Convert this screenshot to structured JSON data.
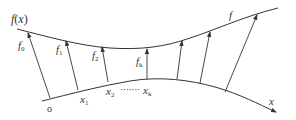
{
  "diagram": {
    "type": "function-mapping-curves",
    "colors": {
      "stroke": "#333333",
      "text": "#333333",
      "background": "#ffffff"
    },
    "upper_curve": {
      "label": "f",
      "points": [
        [
          17,
          29
        ],
        [
          65,
          42
        ],
        [
          100,
          48
        ],
        [
          150,
          48
        ],
        [
          190,
          38
        ],
        [
          230,
          24
        ],
        [
          278,
          8
        ]
      ]
    },
    "lower_curve": {
      "label": "x",
      "points": [
        [
          42,
          101
        ],
        [
          80,
          92
        ],
        [
          110,
          84
        ],
        [
          150,
          79
        ],
        [
          190,
          82
        ],
        [
          230,
          92
        ],
        [
          260,
          104
        ],
        [
          276,
          112
        ]
      ]
    },
    "arrows": [
      {
        "from": [
          50,
          98
        ],
        "to": [
          28,
          33
        ],
        "label": "f0"
      },
      {
        "from": [
          78,
          90
        ],
        "to": [
          66,
          41
        ],
        "label": "f1"
      },
      {
        "from": [
          108,
          82
        ],
        "to": [
          102,
          47
        ],
        "label": "f2"
      },
      {
        "from": [
          147,
          79
        ],
        "to": [
          147,
          49
        ],
        "label": "fk"
      },
      {
        "from": [
          177,
          79
        ],
        "to": [
          182,
          40
        ],
        "label": ""
      },
      {
        "from": [
          200,
          83
        ],
        "to": [
          210,
          31
        ],
        "label": ""
      },
      {
        "from": [
          225,
          92
        ],
        "to": [
          258,
          14
        ],
        "label": ""
      }
    ]
  },
  "labels": {
    "fx_main": "f",
    "fx_paren_open": "(",
    "fx_var": "x",
    "fx_paren_close": ")",
    "f_curve": "f",
    "x_axis": "x",
    "origin": "o",
    "f0_base": "f",
    "f0_sub": "0",
    "f1_base": "f",
    "f1_sub": "1",
    "f2_base": "f",
    "f2_sub": "2",
    "fk_base": "f",
    "fk_sub": "k",
    "x1_base": "x",
    "x1_sub": "1",
    "x2_base": "x",
    "x2_sub": "2",
    "dots": "·······",
    "xk_base": "x",
    "xk_sub": "k"
  }
}
